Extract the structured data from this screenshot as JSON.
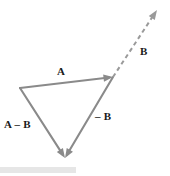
{
  "figure": {
    "kind": "vector-subtraction-triangle",
    "background_color": "#ffffff",
    "stroke_color": "#8a8a8a",
    "dashed_stroke_color": "#9a9a9a",
    "text_color": "#1a1a1a",
    "width": 170,
    "height": 176
  },
  "labels": {
    "a": "A",
    "a_minus_b": "A – B",
    "minus_b": "– B",
    "b": "B"
  },
  "chart_data": {
    "type": "diagram",
    "title": "",
    "points": {
      "left_vertex": [
        20,
        88
      ],
      "head_of_a": [
        113,
        77
      ],
      "bottom_vertex": [
        65,
        158
      ],
      "dashed_tip": [
        157,
        10
      ]
    },
    "vectors": [
      {
        "name": "A",
        "label": "A",
        "from": [
          20,
          88
        ],
        "to": [
          113,
          77
        ],
        "style": "solid",
        "arrow": "head",
        "label_position": [
          57,
          66
        ]
      },
      {
        "name": "minus-B",
        "label": "– B",
        "from": [
          113,
          77
        ],
        "to": [
          65,
          158
        ],
        "style": "solid",
        "arrow": "head",
        "label_position": [
          95,
          111
        ]
      },
      {
        "name": "A-minus-B",
        "label": "A – B",
        "from": [
          20,
          88
        ],
        "to": [
          65,
          158
        ],
        "style": "solid",
        "arrow": "head",
        "label_position": [
          4,
          119
        ]
      },
      {
        "name": "B",
        "label": "B",
        "from": [
          113,
          77
        ],
        "to": [
          157,
          10
        ],
        "style": "dashed",
        "arrow": "head",
        "label_position": [
          140,
          46
        ]
      }
    ],
    "grid": false,
    "legend": false
  },
  "footer": {
    "bar_color": "#e6e6e6",
    "bar_width": 76
  }
}
